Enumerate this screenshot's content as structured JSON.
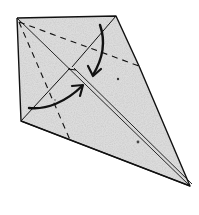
{
  "diagram": {
    "type": "origami-fold-diagram",
    "paper_color": "#dcdcdc",
    "line_color": "#111111",
    "vertices": {
      "top_left": [
        17,
        18
      ],
      "top_right": [
        116,
        16
      ],
      "left": [
        21,
        121
      ],
      "bottom_tip": [
        190,
        186
      ],
      "right_edge_point": [
        139,
        66
      ],
      "flap_corner": [
        70,
        68
      ]
    },
    "arrows": [
      {
        "name": "fold-arrow-down",
        "from": [
          100,
          25
        ],
        "to": [
          93,
          75
        ],
        "direction": "down"
      },
      {
        "name": "fold-arrow-right",
        "from": [
          29,
          108
        ],
        "to": [
          82,
          86
        ],
        "direction": "up-right"
      }
    ],
    "creases": {
      "valley_dashed": [
        {
          "from": [
            19,
            22
          ],
          "to": [
            139,
            66
          ]
        },
        {
          "from": [
            19,
            22
          ],
          "to": [
            70,
            140
          ]
        }
      ],
      "center_double_line": {
        "from": [
          17,
          18
        ],
        "to": [
          190,
          186
        ]
      }
    }
  }
}
